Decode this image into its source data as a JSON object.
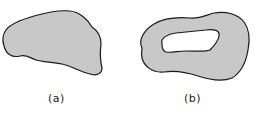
{
  "figures": [
    {
      "id": "a",
      "label": "(a)",
      "description": "simply connected region"
    },
    {
      "id": "b",
      "label": "(b)",
      "description": "region with a hole"
    }
  ],
  "colors": {
    "fill": "#c8c8c8",
    "stroke": "#1a1a1a",
    "hole": "#ffffff",
    "background": "#ffffff"
  }
}
